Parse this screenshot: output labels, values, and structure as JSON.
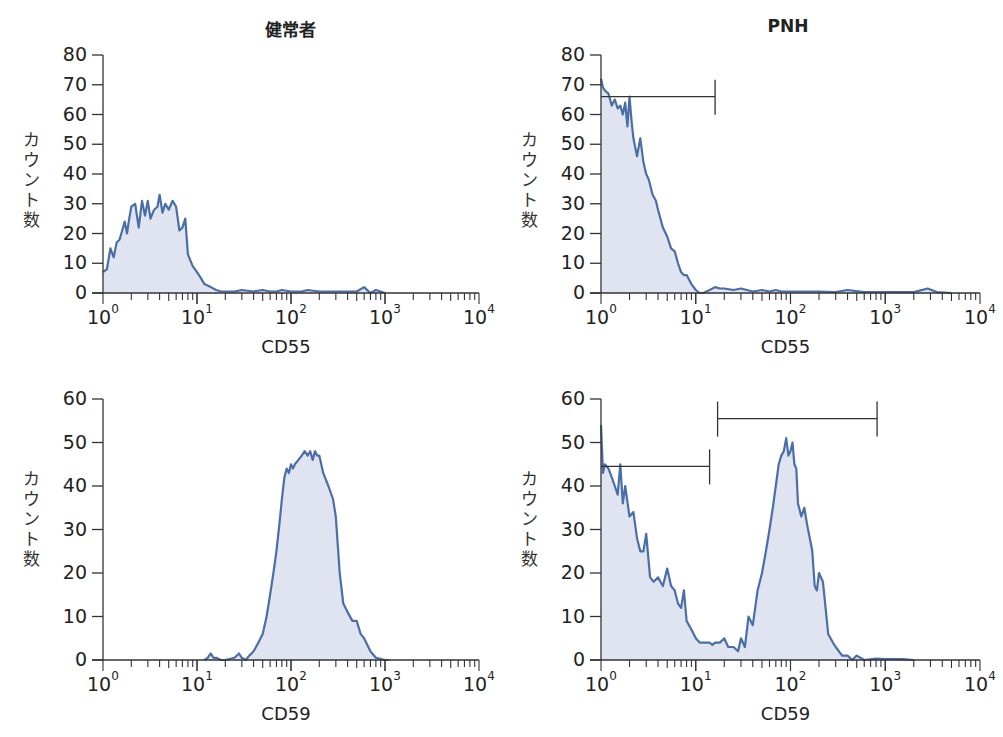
{
  "titles": {
    "normal": "健常者",
    "pnh": "PNH"
  },
  "y_axis_label": "カウント数",
  "colors": {
    "line": "#4a6fa8",
    "fill": "#dfe4f0",
    "axis": "#333333",
    "gate": "#333333"
  },
  "chart_data": [
    {
      "id": "normal-cd55",
      "type": "area",
      "title": "健常者",
      "xlabel": "CD55",
      "ylabel": "カウント数",
      "xscale": "log",
      "xlim": [
        1,
        10000
      ],
      "ylim": [
        0,
        80
      ],
      "yticks": [
        0,
        10,
        20,
        30,
        40,
        50,
        60,
        70,
        80
      ],
      "xtick_labels": [
        "10^0",
        "10^1",
        "10^2",
        "10^3",
        "10^4"
      ],
      "x": [
        1,
        1.1,
        1.2,
        1.3,
        1.4,
        1.5,
        1.6,
        1.7,
        1.8,
        1.9,
        2.0,
        2.2,
        2.4,
        2.6,
        2.8,
        3.0,
        3.2,
        3.5,
        3.8,
        4.0,
        4.3,
        4.6,
        5.0,
        5.5,
        6.0,
        6.5,
        7.0,
        7.5,
        8.0,
        9.0,
        10,
        11,
        12,
        14,
        16,
        18,
        20,
        25,
        30,
        40,
        50,
        60,
        70,
        80,
        100,
        130,
        150,
        200,
        250,
        300,
        400,
        500,
        600,
        700,
        800,
        1000
      ],
      "values": [
        7,
        8,
        15,
        12,
        17,
        18,
        21,
        24,
        20,
        25,
        29,
        30,
        22,
        31,
        26,
        31,
        25,
        28,
        29,
        33,
        27,
        30,
        28,
        31,
        29,
        21,
        22,
        25,
        13,
        9,
        7,
        5,
        3,
        2,
        1,
        0.5,
        0.5,
        0.5,
        1,
        0.5,
        1,
        0.5,
        0.5,
        1,
        0.5,
        0.5,
        1,
        0.5,
        0.5,
        0.5,
        0.5,
        0.5,
        2,
        0,
        1,
        0
      ],
      "gates": []
    },
    {
      "id": "pnh-cd55",
      "type": "area",
      "title": "PNH",
      "xlabel": "CD55",
      "ylabel": "カウント数",
      "xscale": "log",
      "xlim": [
        1,
        10000
      ],
      "ylim": [
        0,
        80
      ],
      "yticks": [
        0,
        10,
        20,
        30,
        40,
        50,
        60,
        70,
        80
      ],
      "xtick_labels": [
        "10^0",
        "10^1",
        "10^2",
        "10^3",
        "10^4"
      ],
      "x": [
        1,
        1.05,
        1.1,
        1.2,
        1.3,
        1.4,
        1.5,
        1.6,
        1.7,
        1.8,
        1.9,
        2.0,
        2.1,
        2.2,
        2.4,
        2.6,
        2.8,
        3.0,
        3.2,
        3.5,
        3.8,
        4.0,
        4.5,
        5.0,
        5.5,
        6.0,
        6.5,
        7.0,
        7.5,
        8.0,
        9.0,
        10,
        11,
        12,
        14,
        16,
        18,
        20,
        25,
        30,
        40,
        50,
        60,
        70,
        80,
        100,
        150,
        200,
        300,
        400,
        600,
        1000,
        2000,
        2800,
        3500,
        5000
      ],
      "values": [
        72,
        69,
        68,
        67,
        63,
        65,
        62,
        63,
        60,
        64,
        56,
        66,
        58,
        52,
        46,
        52,
        44,
        40,
        38,
        33,
        31,
        28,
        22,
        19,
        15,
        14,
        10,
        7,
        6,
        6,
        3,
        1,
        0,
        0,
        1,
        2,
        1.5,
        1.5,
        1,
        1.5,
        0.5,
        1,
        0.5,
        1,
        0.5,
        0.5,
        0.5,
        0.5,
        0.3,
        1,
        0.3,
        0.3,
        0.3,
        1.5,
        0.3,
        0
      ],
      "gates": [
        {
          "x_start": 1.0,
          "x_end": 16,
          "y": 66
        }
      ]
    },
    {
      "id": "normal-cd59",
      "type": "area",
      "title": "健常者",
      "xlabel": "CD59",
      "ylabel": "カウント数",
      "xscale": "log",
      "xlim": [
        1,
        10000
      ],
      "ylim": [
        0,
        60
      ],
      "yticks": [
        0,
        10,
        20,
        30,
        40,
        50,
        60
      ],
      "xtick_labels": [
        "10^0",
        "10^1",
        "10^2",
        "10^3",
        "10^4"
      ],
      "x": [
        12,
        13,
        14,
        15,
        16,
        18,
        20,
        25,
        28,
        30,
        33,
        36,
        40,
        45,
        50,
        55,
        60,
        65,
        70,
        75,
        80,
        85,
        90,
        95,
        100,
        105,
        110,
        120,
        130,
        140,
        150,
        160,
        170,
        180,
        190,
        200,
        220,
        250,
        280,
        300,
        330,
        360,
        400,
        450,
        500,
        550,
        600,
        700,
        800,
        1000,
        1100
      ],
      "values": [
        0,
        0.5,
        1.5,
        0.5,
        0.5,
        0,
        0,
        0.5,
        1.5,
        0.5,
        0,
        1,
        2,
        4,
        6,
        10,
        15,
        20,
        25,
        31,
        37,
        42,
        44,
        43,
        45,
        44,
        45,
        46,
        47,
        48,
        47,
        48,
        46,
        48,
        47,
        47,
        43,
        40,
        37,
        33,
        20,
        13,
        11,
        9,
        9,
        6,
        5,
        2,
        0.5,
        0,
        0
      ],
      "gates": []
    },
    {
      "id": "pnh-cd59",
      "type": "area",
      "title": "PNH",
      "xlabel": "CD59",
      "ylabel": "カウント数",
      "xscale": "log",
      "xlim": [
        1,
        10000
      ],
      "ylim": [
        0,
        60
      ],
      "yticks": [
        0,
        10,
        20,
        30,
        40,
        50,
        60
      ],
      "xtick_labels": [
        "10^0",
        "10^1",
        "10^2",
        "10^3",
        "10^4"
      ],
      "x": [
        1,
        1.05,
        1.1,
        1.2,
        1.3,
        1.4,
        1.5,
        1.6,
        1.7,
        1.8,
        2.0,
        2.2,
        2.4,
        2.6,
        2.8,
        3.0,
        3.3,
        3.6,
        4.0,
        4.5,
        5.0,
        5.5,
        6.0,
        6.5,
        7.0,
        7.5,
        8.0,
        9.0,
        10,
        11,
        12,
        14,
        15,
        16,
        18,
        20,
        22,
        25,
        28,
        30,
        33,
        36,
        40,
        45,
        50,
        55,
        60,
        65,
        70,
        75,
        80,
        85,
        90,
        95,
        100,
        105,
        110,
        115,
        120,
        130,
        140,
        150,
        160,
        170,
        180,
        190,
        200,
        220,
        250,
        280,
        300,
        350,
        400,
        450,
        500,
        600,
        800,
        1000,
        1500,
        2000
      ],
      "values": [
        54,
        43,
        45,
        44,
        42,
        40,
        38,
        45,
        36,
        40,
        33,
        34,
        28,
        25,
        25,
        29,
        19,
        18,
        19,
        17,
        21,
        17,
        16,
        13,
        12,
        16,
        9,
        7,
        5,
        4,
        4,
        4,
        3.5,
        4,
        4,
        5,
        3,
        3,
        2,
        5,
        3,
        10,
        8,
        16,
        20,
        25,
        30,
        35,
        40,
        45,
        47,
        48,
        51,
        47,
        48,
        50,
        45,
        44,
        36,
        33,
        35,
        31,
        28,
        25,
        17,
        16,
        20,
        18,
        6,
        4,
        3,
        1,
        1,
        0,
        1,
        0,
        0.3,
        0.2,
        0.2,
        0
      ],
      "gates": [
        {
          "x_start": 1.0,
          "x_end": 14,
          "y": 44.5
        },
        {
          "x_start": 17,
          "x_end": 820,
          "y": 55.5
        }
      ]
    }
  ]
}
